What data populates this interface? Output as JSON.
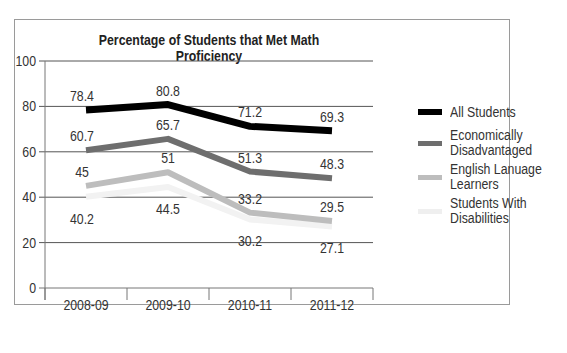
{
  "chart_data": {
    "type": "line",
    "title": "Percentage of Students that Met Math Proficiency",
    "xlabel": "",
    "ylabel": "",
    "categories": [
      "2008-09",
      "2009-10",
      "2010-11",
      "2011-12"
    ],
    "ylim": [
      0,
      100
    ],
    "yticks": [
      0,
      20,
      40,
      60,
      80,
      100
    ],
    "grid": true,
    "legend_position": "right",
    "series": [
      {
        "name": "All Students",
        "values": [
          78.4,
          80.8,
          71.2,
          69.3
        ],
        "color": "#000000"
      },
      {
        "name": "Economically Disadvantaged",
        "values": [
          60.7,
          65.7,
          51.3,
          48.3
        ],
        "color": "#6e6e6e"
      },
      {
        "name": "English Lanuage Learners",
        "values": [
          45,
          51,
          33.2,
          29.5
        ],
        "color": "#bdbdbd"
      },
      {
        "name": "Students With Disabilities",
        "values": [
          40.2,
          44.5,
          30.2,
          27.1
        ],
        "color": "#f2f2f2"
      }
    ],
    "data_labels": {
      "All Students": [
        "78.4",
        "80.8",
        "71.2",
        "69.3"
      ],
      "Economically Disadvantaged": [
        "60.7",
        "65.7",
        "51.3",
        "48.3"
      ],
      "English Lanuage Learners": [
        "45",
        "51",
        "33.2",
        "29.5"
      ],
      "Students With Disabilities": [
        "40.2",
        "44.5",
        "30.2",
        "27.1"
      ]
    }
  },
  "legend": {
    "items": [
      {
        "line1": "All Students",
        "line2": ""
      },
      {
        "line1": "Economically",
        "line2": "Disadvantaged"
      },
      {
        "line1": "English Lanuage",
        "line2": "Learners"
      },
      {
        "line1": "Students With",
        "line2": "Disabilities"
      }
    ]
  }
}
